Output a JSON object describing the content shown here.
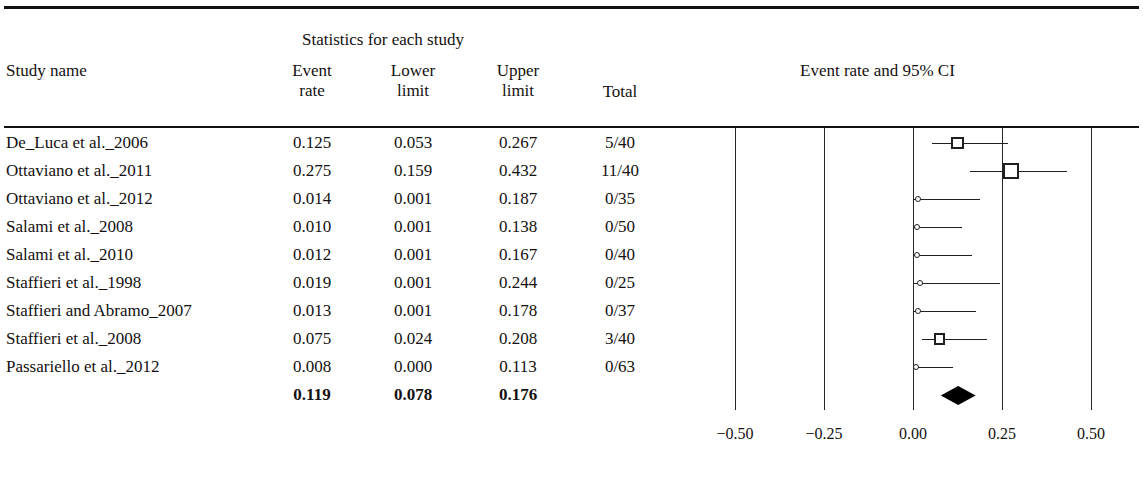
{
  "header": {
    "stats_title": "Statistics for each study",
    "study_name_label": "Study name",
    "plot_title": "Event rate and 95% CI",
    "columns": {
      "event_rate_l1": "Event",
      "event_rate_l2": "rate",
      "lower_limit_l1": "Lower",
      "lower_limit_l2": "limit",
      "upper_limit_l1": "Upper",
      "upper_limit_l2": "limit",
      "total": "Total"
    }
  },
  "rows": [
    {
      "name": "De_Luca et al._2006",
      "event_rate": "0.125",
      "lower_limit": "0.053",
      "upper_limit": "0.267",
      "total": "5/40"
    },
    {
      "name": "Ottaviano et al._2011",
      "event_rate": "0.275",
      "lower_limit": "0.159",
      "upper_limit": "0.432",
      "total": "11/40"
    },
    {
      "name": "Ottaviano et al._2012",
      "event_rate": "0.014",
      "lower_limit": "0.001",
      "upper_limit": "0.187",
      "total": "0/35"
    },
    {
      "name": "Salami et al._2008",
      "event_rate": "0.010",
      "lower_limit": "0.001",
      "upper_limit": "0.138",
      "total": "0/50"
    },
    {
      "name": "Salami et al._2010",
      "event_rate": "0.012",
      "lower_limit": "0.001",
      "upper_limit": "0.167",
      "total": "0/40"
    },
    {
      "name": "Staffieri et al._1998",
      "event_rate": "0.019",
      "lower_limit": "0.001",
      "upper_limit": "0.244",
      "total": "0/25"
    },
    {
      "name": "Staffieri and Abramo_2007",
      "event_rate": "0.013",
      "lower_limit": "0.001",
      "upper_limit": "0.178",
      "total": "0/37"
    },
    {
      "name": "Staffieri et al._2008",
      "event_rate": "0.075",
      "lower_limit": "0.024",
      "upper_limit": "0.208",
      "total": "3/40"
    },
    {
      "name": "Passariello et al._2012",
      "event_rate": "0.008",
      "lower_limit": "0.000",
      "upper_limit": "0.113",
      "total": "0/63"
    },
    {
      "name": "",
      "event_rate": "0.119",
      "lower_limit": "0.078",
      "upper_limit": "0.176",
      "total": "",
      "summary": true
    }
  ],
  "chart_data": {
    "type": "forest",
    "title": "Event rate and 95% CI",
    "xlabel": "",
    "ylabel": "",
    "xlim": [
      -0.625,
      0.625
    ],
    "grid": true,
    "legend": "none",
    "tick_labels": [
      "−0.50",
      "−0.25",
      "0.00",
      "0.25",
      "0.50"
    ],
    "tick_values": [
      -0.5,
      -0.25,
      0.0,
      0.25,
      0.5
    ],
    "studies": [
      {
        "label": "De_Luca et al._2006",
        "effect": 0.125,
        "ci_low": 0.053,
        "ci_high": 0.267,
        "events": 5,
        "n": 40,
        "marker": "square",
        "weight": 3
      },
      {
        "label": "Ottaviano et al._2011",
        "effect": 0.275,
        "ci_low": 0.159,
        "ci_high": 0.432,
        "events": 11,
        "n": 40,
        "marker": "square",
        "weight": 5
      },
      {
        "label": "Ottaviano et al._2012",
        "effect": 0.014,
        "ci_low": 0.001,
        "ci_high": 0.187,
        "events": 0,
        "n": 35,
        "marker": "dot",
        "weight": 1
      },
      {
        "label": "Salami et al._2008",
        "effect": 0.01,
        "ci_low": 0.001,
        "ci_high": 0.138,
        "events": 0,
        "n": 50,
        "marker": "dot",
        "weight": 1
      },
      {
        "label": "Salami et al._2010",
        "effect": 0.012,
        "ci_low": 0.001,
        "ci_high": 0.167,
        "events": 0,
        "n": 40,
        "marker": "dot",
        "weight": 1
      },
      {
        "label": "Staffieri et al._1998",
        "effect": 0.019,
        "ci_low": 0.001,
        "ci_high": 0.244,
        "events": 0,
        "n": 25,
        "marker": "dot",
        "weight": 1
      },
      {
        "label": "Staffieri and Abramo_2007",
        "effect": 0.013,
        "ci_low": 0.001,
        "ci_high": 0.178,
        "events": 0,
        "n": 37,
        "marker": "dot",
        "weight": 1
      },
      {
        "label": "Staffieri et al._2008",
        "effect": 0.075,
        "ci_low": 0.024,
        "ci_high": 0.208,
        "events": 3,
        "n": 40,
        "marker": "square",
        "weight": 2
      },
      {
        "label": "Passariello et al._2012",
        "effect": 0.008,
        "ci_low": 0.0,
        "ci_high": 0.113,
        "events": 0,
        "n": 63,
        "marker": "dot",
        "weight": 1
      }
    ],
    "summary": {
      "effect": 0.119,
      "ci_low": 0.078,
      "ci_high": 0.176,
      "marker": "diamond"
    }
  }
}
